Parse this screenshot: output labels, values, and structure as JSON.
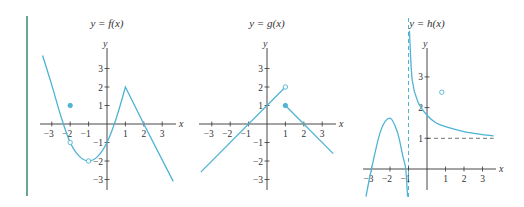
{
  "accent_bar_color": "#5a9a8a",
  "curve_color": "#4fb3d4",
  "axis_color": "#333333",
  "chart_data": [
    {
      "type": "line",
      "title": "y = f(x)",
      "xlabel": "x",
      "ylabel": "y",
      "xticks": [
        -3,
        -2,
        -1,
        1,
        2,
        3
      ],
      "yticks": [
        -3,
        -2,
        -1,
        1,
        2,
        3
      ],
      "xlim": [
        -3.5,
        3.7
      ],
      "ylim": [
        -3.4,
        3.8
      ],
      "grid": false,
      "series": [
        {
          "name": "curve",
          "points": [
            [
              -3.5,
              3.7
            ],
            [
              -3,
              2.1
            ],
            [
              -2.5,
              0.4
            ],
            [
              -2,
              -1
            ],
            [
              -1.5,
              -1.75
            ],
            [
              -1,
              -2
            ],
            [
              -0.5,
              -1.75
            ],
            [
              0,
              -1
            ],
            [
              0.5,
              0.3
            ],
            [
              1,
              2
            ],
            [
              2,
              0
            ],
            [
              3.6,
              -3.1
            ]
          ]
        }
      ],
      "markers": [
        {
          "x": -2,
          "y": 1,
          "style": "filled"
        },
        {
          "x": -2,
          "y": -1,
          "style": "open"
        },
        {
          "x": -1,
          "y": -2,
          "style": "open"
        }
      ]
    },
    {
      "type": "line",
      "title": "y = g(x)",
      "xlabel": "x",
      "ylabel": "y",
      "xticks": [
        -3,
        -2,
        -1,
        1,
        2,
        3
      ],
      "yticks": [
        -3,
        -2,
        -1,
        1,
        2,
        3
      ],
      "xlim": [
        -3.6,
        3.7
      ],
      "ylim": [
        -3.4,
        3.8
      ],
      "grid": false,
      "series": [
        {
          "name": "left",
          "points": [
            [
              -3.6,
              -2.6
            ],
            [
              1,
              2
            ]
          ]
        },
        {
          "name": "right",
          "points": [
            [
              1,
              1
            ],
            [
              3.6,
              -1.6
            ]
          ]
        }
      ],
      "markers": [
        {
          "x": 1,
          "y": 2,
          "style": "open"
        },
        {
          "x": 1,
          "y": 1,
          "style": "filled"
        }
      ]
    },
    {
      "type": "line",
      "title": "y = h(x)",
      "xlabel": "x",
      "ylabel": "y",
      "xticks": [
        -3,
        -2,
        -1,
        1,
        2,
        3
      ],
      "yticks": [
        1,
        2,
        3
      ],
      "xlim": [
        -3.4,
        3.7
      ],
      "ylim": [
        -1,
        4.8
      ],
      "grid": false,
      "asymptotes": [
        {
          "type": "vertical",
          "x": -1,
          "style": "dashed"
        },
        {
          "type": "horizontal",
          "y": 1,
          "style": "dashed",
          "from_x": 0,
          "to_x": 3.6
        }
      ],
      "series": [
        {
          "name": "left-branch",
          "points": [
            [
              -3.3,
              -0.9
            ],
            [
              -3,
              0
            ],
            [
              -2.5,
              1.25
            ],
            [
              -2,
              1.66
            ],
            [
              -1.6,
              1.2
            ],
            [
              -1.3,
              0.4
            ],
            [
              -1.15,
              0
            ],
            [
              -1.05,
              -0.9
            ]
          ]
        },
        {
          "name": "right-branch",
          "points": [
            [
              -0.95,
              4.5
            ],
            [
              -0.8,
              2.9
            ],
            [
              -0.5,
              2.2
            ],
            [
              0,
              1.75
            ],
            [
              0.5,
              1.5
            ],
            [
              1,
              1.38
            ],
            [
              2,
              1.22
            ],
            [
              3,
              1.12
            ],
            [
              3.6,
              1.08
            ]
          ]
        }
      ],
      "markers": [
        {
          "x": 0.8,
          "y": 2.5,
          "style": "open"
        }
      ]
    }
  ]
}
